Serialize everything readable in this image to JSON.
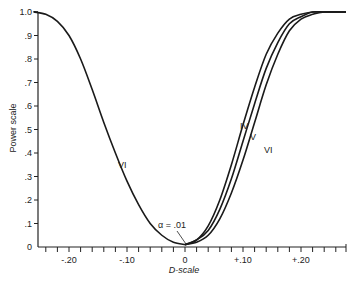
{
  "chart_data": {
    "type": "line",
    "title": "",
    "xlabel": "D-scale",
    "ylabel": "Power scale",
    "xlim": [
      -0.27,
      0.27
    ],
    "ylim": [
      0,
      1.0
    ],
    "grid": false,
    "legend": "inline curve labels",
    "x_ticks": [
      "-.20",
      "-.10",
      "0",
      "+.10",
      "+.20"
    ],
    "y_ticks": [
      "0",
      ".1",
      ".2",
      ".3",
      ".4",
      ".5",
      ".6",
      ".7",
      ".8",
      ".9",
      "1.0"
    ],
    "annotation": "α = .01",
    "series": [
      {
        "name": "VI",
        "side": "negative",
        "x": [
          -0.26,
          -0.24,
          -0.22,
          -0.2,
          -0.18,
          -0.16,
          -0.14,
          -0.12,
          -0.1,
          -0.08,
          -0.06,
          -0.04,
          -0.02,
          0.0
        ],
        "y": [
          1.0,
          0.99,
          0.96,
          0.9,
          0.8,
          0.67,
          0.53,
          0.4,
          0.28,
          0.18,
          0.1,
          0.05,
          0.02,
          0.01
        ]
      },
      {
        "name": "IV",
        "side": "positive",
        "x": [
          0.0,
          0.02,
          0.04,
          0.06,
          0.08,
          0.1,
          0.12,
          0.14,
          0.16,
          0.18,
          0.2,
          0.22,
          0.24
        ],
        "y": [
          0.01,
          0.03,
          0.09,
          0.2,
          0.35,
          0.52,
          0.68,
          0.82,
          0.91,
          0.97,
          0.99,
          1.0,
          1.0
        ]
      },
      {
        "name": "V",
        "side": "positive",
        "x": [
          0.0,
          0.02,
          0.04,
          0.06,
          0.08,
          0.1,
          0.12,
          0.14,
          0.16,
          0.18,
          0.2,
          0.22,
          0.24
        ],
        "y": [
          0.01,
          0.03,
          0.07,
          0.16,
          0.29,
          0.45,
          0.61,
          0.76,
          0.87,
          0.95,
          0.98,
          1.0,
          1.0
        ]
      },
      {
        "name": "VI",
        "side": "positive",
        "x": [
          0.0,
          0.02,
          0.04,
          0.06,
          0.08,
          0.1,
          0.12,
          0.14,
          0.16,
          0.18,
          0.2,
          0.22,
          0.24
        ],
        "y": [
          0.01,
          0.02,
          0.05,
          0.12,
          0.23,
          0.37,
          0.53,
          0.69,
          0.82,
          0.92,
          0.97,
          0.99,
          1.0
        ]
      }
    ]
  },
  "labels": {
    "xlabel": "D-scale",
    "ylabel": "Power scale",
    "annotation": "α = .01",
    "curve_vi_left": "VI",
    "curve_iv": "IV",
    "curve_v": "V",
    "curve_vi_right": "VI"
  }
}
